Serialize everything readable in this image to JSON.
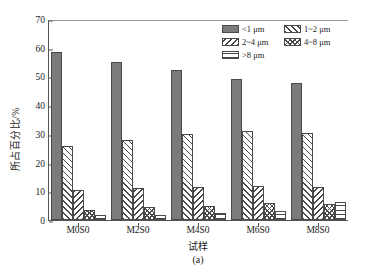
{
  "chart_data": {
    "type": "bar",
    "title": "",
    "subtitle": "",
    "panel_caption": "(a)",
    "xlabel": "试样",
    "ylabel": "所占百分比/%",
    "categories": [
      "M0S0",
      "M2S0",
      "M4S0",
      "M6S0",
      "M8S0"
    ],
    "ylim": [
      0,
      70
    ],
    "ytick_values": [
      0,
      10,
      20,
      30,
      40,
      50,
      60,
      70
    ],
    "ytick_labels": [
      "0",
      "10",
      "20",
      "30",
      "40",
      "50",
      "60",
      "70"
    ],
    "grid": false,
    "legend_position": "upper-right",
    "series": [
      {
        "name": "<1 μm",
        "pattern": "solid-gray",
        "color": "#7b7b7b",
        "values": [
          58.5,
          54.9,
          52.2,
          49.2,
          47.8
        ]
      },
      {
        "name": "1~2 μm",
        "pattern": "forward-hatch",
        "color": "#ffffff",
        "values": [
          25.8,
          27.9,
          29.8,
          31.0,
          30.4
        ]
      },
      {
        "name": "2~4 μm",
        "pattern": "backward-hatch",
        "color": "#ffffff",
        "values": [
          10.5,
          11.0,
          11.5,
          12.0,
          11.5
        ]
      },
      {
        "name": "4~8 μm",
        "pattern": "cross-hatch",
        "color": "#ffffff",
        "values": [
          3.5,
          4.7,
          5.0,
          6.0,
          5.6
        ]
      },
      {
        "name": ">8 μm",
        "pattern": "horizontal-lines",
        "color": "#ffffff",
        "values": [
          1.8,
          1.8,
          2.5,
          3.1,
          6.3
        ]
      }
    ]
  },
  "legend": {
    "entries": [
      {
        "label": "<1 μm",
        "swatch": "solid-gray"
      },
      {
        "label": "1~2 μm",
        "swatch": "forward-hatch"
      },
      {
        "label": "2~4 μm",
        "swatch": "backward-hatch"
      },
      {
        "label": "4~8 μm",
        "swatch": "cross-hatch"
      },
      {
        "label": ">8 μm",
        "swatch": "horizontal-lines"
      }
    ]
  }
}
